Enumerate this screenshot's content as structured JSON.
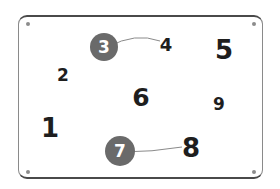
{
  "board": {
    "frame_color": "#4a4a4a",
    "circle_color": "#6a6a6a",
    "link_color": "#8a8a8a"
  },
  "corner_dots": [
    {
      "x": 28,
      "y": 24
    },
    {
      "x": 254,
      "y": 24
    },
    {
      "x": 28,
      "y": 172
    },
    {
      "x": 254,
      "y": 172
    }
  ],
  "numbers": [
    {
      "label": "1",
      "x": 50,
      "y": 128,
      "size": 26,
      "circled": false
    },
    {
      "label": "2",
      "x": 63,
      "y": 75,
      "size": 17,
      "circled": false
    },
    {
      "label": "3",
      "x": 104,
      "y": 47,
      "size": 17,
      "circled": true,
      "radius": 14
    },
    {
      "label": "4",
      "x": 166,
      "y": 45,
      "size": 18,
      "circled": false
    },
    {
      "label": "5",
      "x": 224,
      "y": 50,
      "size": 26,
      "circled": false
    },
    {
      "label": "6",
      "x": 141,
      "y": 97,
      "size": 25,
      "circled": false
    },
    {
      "label": "7",
      "x": 120,
      "y": 151,
      "size": 17,
      "circled": true,
      "radius": 15
    },
    {
      "label": "8",
      "x": 191,
      "y": 148,
      "size": 26,
      "circled": false
    },
    {
      "label": "9",
      "x": 219,
      "y": 104,
      "size": 17,
      "circled": false
    }
  ],
  "links": [
    {
      "from": "3",
      "to": "4",
      "path": "M108,47 Q135,32 160,41"
    },
    {
      "from": "7",
      "to": "8",
      "path": "M122,152 Q152,152 182,147"
    }
  ]
}
